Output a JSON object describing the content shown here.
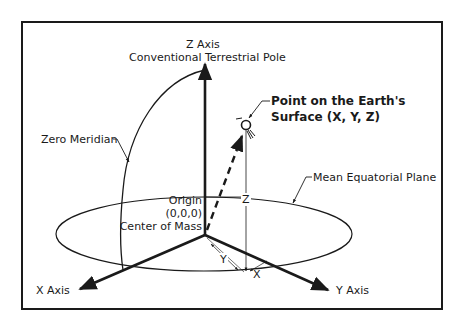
{
  "diagram": {
    "type": "3d-coordinate-system",
    "labels": {
      "z_axis": "Z Axis",
      "z_axis_sub": "Conventional Terrestrial Pole",
      "point_line1": "Point on the Earth's",
      "point_line2": "Surface (X, Y, Z)",
      "zero_meridian": "Zero Meridian",
      "equatorial_plane": "Mean Equatorial Plane",
      "origin": "Origin",
      "origin_coords": "(0,0,0)",
      "center_of_mass": "Center of Mass",
      "x_axis": "X Axis",
      "y_axis": "Y Axis",
      "z_component": "Z",
      "y_component": "Y",
      "x_component": "X"
    },
    "colors": {
      "ink": "#1a1a1a",
      "background": "#ffffff"
    }
  }
}
